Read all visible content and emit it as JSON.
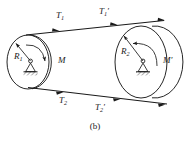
{
  "figure": {
    "caption": "(b)",
    "caption_top": 121,
    "stroke_color": "#1a1a1a",
    "background_color": "#ffffff",
    "labels": [
      {
        "key": "T1",
        "base": "T",
        "sub": "1",
        "prime": "",
        "x": 56,
        "y": 11
      },
      {
        "key": "T1prime",
        "base": "T",
        "sub": "1",
        "prime": "′",
        "x": 99,
        "y": 7
      },
      {
        "key": "T2",
        "base": "T",
        "sub": "2",
        "prime": "",
        "x": 59,
        "y": 96
      },
      {
        "key": "T2prime",
        "base": "T",
        "sub": "2",
        "prime": "′",
        "x": 95,
        "y": 103
      },
      {
        "key": "R1",
        "base": "R",
        "sub": "1",
        "prime": "",
        "x": 14,
        "y": 52
      },
      {
        "key": "R2",
        "base": "R",
        "sub": "2",
        "prime": "",
        "x": 121,
        "y": 47
      },
      {
        "key": "M",
        "base": "M",
        "sub": "",
        "prime": "",
        "x": 58,
        "y": 56
      },
      {
        "key": "Mprime",
        "base": "M",
        "sub": "",
        "prime": "′",
        "x": 163,
        "y": 56
      }
    ],
    "pulley_left": {
      "name": "pulley-1",
      "cx": 30,
      "cy": 62,
      "rx": 22,
      "ry": 27,
      "radius_label": "R1",
      "moment_label": "M",
      "moment_direction": "clockwise"
    },
    "pulley_right": {
      "name": "pulley-2",
      "cx": 146,
      "cy": 62,
      "rx": 28,
      "ry": 36,
      "radius_label": "R2",
      "moment_label": "M′",
      "moment_direction": "counterclockwise"
    },
    "belt_top": {
      "name": "belt-top-span",
      "x1": 26,
      "y1": 35,
      "x2": 163,
      "y2": 20,
      "tension_near": "T1",
      "tension_far": "T1′"
    },
    "belt_bottom": {
      "name": "belt-bottom-span",
      "x1": 28,
      "y1": 88,
      "x2": 166,
      "y2": 104,
      "tension_near": "T2",
      "tension_far": "T2′"
    }
  }
}
